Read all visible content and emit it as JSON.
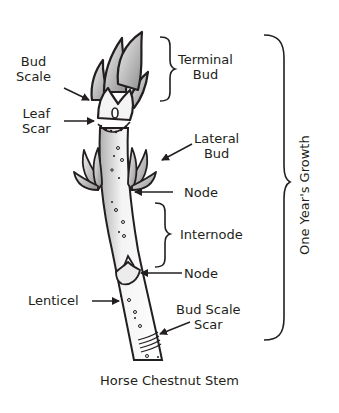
{
  "diagram": {
    "title": "Horse Chestnut Stem",
    "labels": {
      "bud_scale": [
        "Bud",
        "Scale"
      ],
      "leaf_scar": [
        "Leaf",
        "Scar"
      ],
      "terminal_bud": [
        "Terminal",
        "Bud"
      ],
      "lateral_bud": [
        "Lateral",
        "Bud"
      ],
      "node_upper": "Node",
      "internode": "Internode",
      "node_lower": "Node",
      "lenticel": "Lenticel",
      "bud_scale_scar": [
        "Bud Scale",
        "Scar"
      ],
      "one_years_growth": "One Year's Growth"
    },
    "colors": {
      "line": "#231f20",
      "bud_fill_light": "#e6e6e6",
      "bud_fill_dark": "#9a9a9a",
      "stem_shade": "#b5b5b5",
      "background": "#ffffff"
    }
  }
}
